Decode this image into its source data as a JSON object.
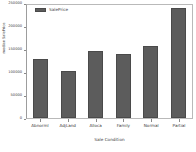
{
  "chart_data": {
    "type": "bar",
    "title": "",
    "subtitle": "",
    "xlabel": "Sale Condition",
    "ylabel": "median SalePrice",
    "categories": [
      "Abnorml",
      "AdjLand",
      "Alloca",
      "Family",
      "Normal",
      "Partial"
    ],
    "values": [
      128000,
      102000,
      146000,
      139000,
      156000,
      239000
    ],
    "series": [
      {
        "name": "SalePrice",
        "values": [
          128000,
          102000,
          146000,
          139000,
          156000,
          239000
        ],
        "color": "#5c5c5c"
      }
    ],
    "ylim": [
      0,
      250000
    ],
    "yticks": [
      0,
      50000,
      100000,
      150000,
      200000,
      250000
    ],
    "ytick_labels": [
      "0",
      "50000",
      "100000",
      "150000",
      "200000",
      "250000"
    ],
    "grid": false,
    "legend": {
      "position": "upper-left",
      "entries": [
        {
          "label": "SalePrice",
          "color": "#5c5c5c"
        }
      ]
    }
  },
  "legend_label": "SalePrice"
}
